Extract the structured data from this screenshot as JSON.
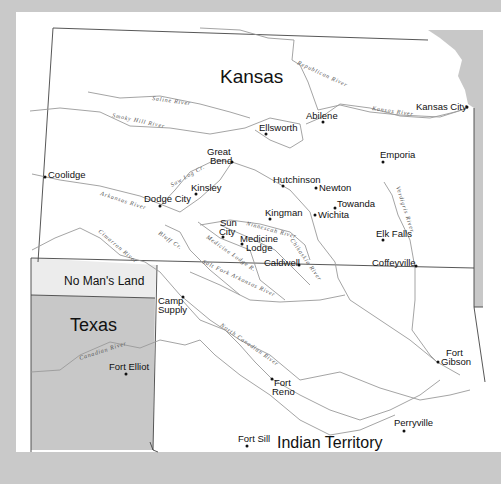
{
  "map": {
    "colors": {
      "background": "#c9c9c9",
      "paper": "#ffffff",
      "shaded_region": "#c8c8c8",
      "no_mans_land": "#ececec",
      "river": "#9a9a9a",
      "border": "#444444"
    },
    "regions": {
      "kansas": "Kansas",
      "no_mans_land": "No Man's Land",
      "texas": "Texas",
      "indian_territory": "Indian Territory"
    },
    "towns": [
      {
        "name": "Kansas City",
        "x": 467,
        "y": 107
      },
      {
        "name": "Abilene",
        "x": 323,
        "y": 122
      },
      {
        "name": "Ellsworth",
        "x": 265,
        "y": 134
      },
      {
        "name": "Emporia",
        "x": 384,
        "y": 161
      },
      {
        "name": "Great",
        "line2": "Bend",
        "x": 231,
        "y": 162
      },
      {
        "name": "Coolidge",
        "x": 45,
        "y": 177
      },
      {
        "name": "Hutchinson",
        "x": 283,
        "y": 186
      },
      {
        "name": "Newton",
        "x": 316,
        "y": 188
      },
      {
        "name": "Kinsley",
        "x": 215,
        "y": 214
      },
      {
        "name": "Dodge City",
        "x": 160,
        "y": 205
      },
      {
        "name": "Towanda",
        "x": 335,
        "y": 208
      },
      {
        "name": "Kingman",
        "x": 270,
        "y": 219
      },
      {
        "name": "Wichita",
        "x": 315,
        "y": 215
      },
      {
        "name": "Sun",
        "line2": "City",
        "x": 223,
        "y": 237
      },
      {
        "name": "Medicine",
        "line2": "Lodge",
        "x": 242,
        "y": 244
      },
      {
        "name": "Elk Falls",
        "x": 383,
        "y": 240
      },
      {
        "name": "Caldwell",
        "x": 299,
        "y": 264
      },
      {
        "name": "Coffeyville",
        "x": 416,
        "y": 267
      },
      {
        "name": "Camp",
        "line2": "Supply",
        "x": 183,
        "y": 297
      },
      {
        "name": "Fort Elliot",
        "x": 126,
        "y": 374
      },
      {
        "name": "Fort",
        "line2": "Gibson",
        "x": 437,
        "y": 362
      },
      {
        "name": "Fort",
        "line2": "Reno",
        "x": 272,
        "y": 379
      },
      {
        "name": "Perryville",
        "x": 404,
        "y": 431
      },
      {
        "name": "Fort Sill",
        "x": 247,
        "y": 446
      }
    ],
    "rivers": [
      "Republican River",
      "Saline River",
      "Smoky Hill River",
      "Kansas River",
      "Saw Log Cr.",
      "Arkansas River",
      "Cimarron River",
      "Bluff Cr.",
      "Medicine Lodge R.",
      "Ninnescah River",
      "Chikaskia River",
      "Verdigris River",
      "Salt Fork Arkansas River",
      "North Canadian River",
      "Canadian River"
    ]
  }
}
